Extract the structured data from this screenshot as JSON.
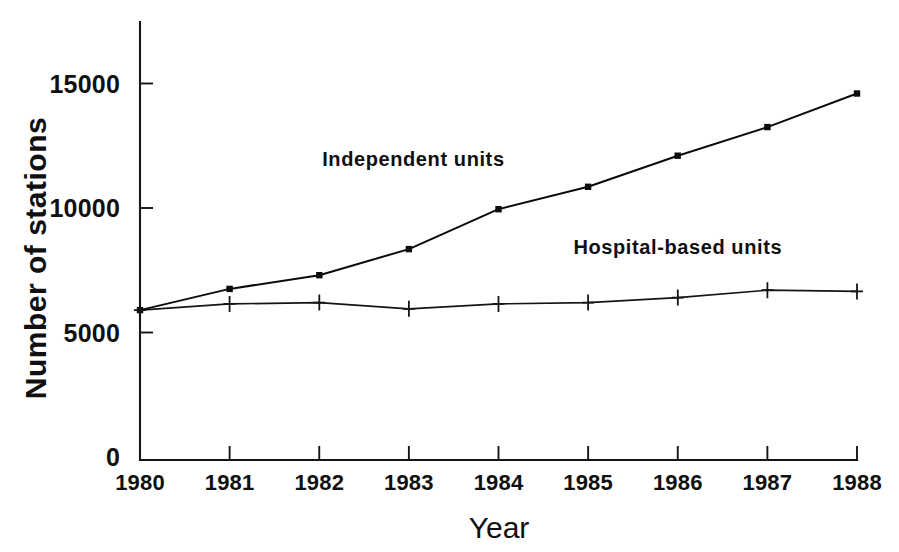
{
  "chart_data": {
    "type": "line",
    "title": "",
    "xlabel": "Year",
    "ylabel": "Number of stations",
    "categories": [
      "1980",
      "1981",
      "1982",
      "1983",
      "1984",
      "1985",
      "1986",
      "1987",
      "1988"
    ],
    "x": [
      1980,
      1981,
      1982,
      1983,
      1984,
      1985,
      1986,
      1987,
      1988
    ],
    "xlim": [
      1980,
      1988
    ],
    "ylim": [
      0,
      16400
    ],
    "yticks": [
      0,
      5000,
      10000,
      15000
    ],
    "ytick_labels": [
      "0",
      "5000",
      "10000",
      "15000"
    ],
    "xticks": [
      1980,
      1981,
      1982,
      1983,
      1984,
      1985,
      1986,
      1987,
      1988
    ],
    "grid": false,
    "legend_position": "inline-annotation",
    "series": [
      {
        "name": "Independent units",
        "marker": "square",
        "color": "#0b0b0b",
        "annotation_text": "Independent units",
        "values": [
          5900,
          6750,
          7300,
          8350,
          9950,
          10850,
          12100,
          13250,
          14600
        ]
      },
      {
        "name": "Hospital-based units",
        "marker": "plus",
        "color": "#141414",
        "annotation_text": "Hospital-based units",
        "values": [
          5900,
          6150,
          6200,
          5950,
          6150,
          6200,
          6400,
          6700,
          6650
        ]
      }
    ],
    "annotations": [
      {
        "text": "Independent units",
        "x": 1983.05,
        "y": 11700
      },
      {
        "text": "Hospital-based units",
        "x": 1986.0,
        "y": 8150
      }
    ]
  },
  "axis": {
    "x_title": "Year",
    "y_title": "Number of stations"
  }
}
